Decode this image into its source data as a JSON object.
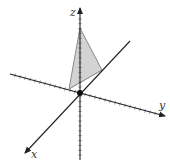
{
  "diagram": {
    "type": "3d-coordinate-axes",
    "axes": {
      "x": {
        "label": "x"
      },
      "y": {
        "label": "y"
      },
      "z": {
        "label": "z"
      }
    },
    "shape": {
      "type": "triangle",
      "description": "plane region in first octant with intercepts on x, y and z axes",
      "fill": "#d3d3d3",
      "stroke": "#888888"
    },
    "origin_marker": true,
    "colors": {
      "axis": "#222222",
      "tick": "#555555",
      "fill": "#d3d3d3"
    }
  }
}
